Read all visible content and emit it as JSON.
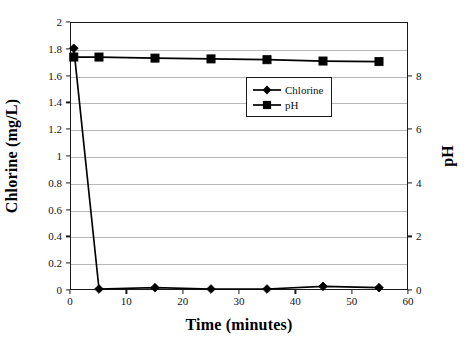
{
  "chart_data": {
    "type": "line",
    "title": "",
    "xlabel": "Time (minutes)",
    "ylabel": "Chlorine (mg/L)",
    "ylabel_secondary": "pH",
    "xlim": [
      0,
      60
    ],
    "ylim": [
      0,
      2
    ],
    "ylim_secondary": [
      0,
      10
    ],
    "grid": true,
    "legend_position": "inside-upper-right",
    "xticks": [
      "0",
      "10",
      "20",
      "30",
      "40",
      "50",
      "60"
    ],
    "xtick_values": [
      0,
      10,
      20,
      30,
      40,
      50,
      60
    ],
    "yticks_left": [
      "0",
      "0.2",
      "0.4",
      "0.6",
      "0.8",
      "1",
      "1.2",
      "1.4",
      "1.6",
      "1.8",
      "2"
    ],
    "ytick_values_left": [
      0,
      0.2,
      0.4,
      0.6,
      0.8,
      1,
      1.2,
      1.4,
      1.6,
      1.8,
      2
    ],
    "yticks_right": [
      "0",
      "2",
      "4",
      "6",
      "8"
    ],
    "ytick_values_right": [
      0,
      2,
      4,
      6,
      8
    ],
    "series": [
      {
        "name": "Chlorine",
        "axis": "left",
        "marker": "diamond",
        "color": "#000000",
        "x": [
          0.5,
          5,
          15,
          25,
          35,
          45,
          55
        ],
        "values": [
          1.81,
          0.0,
          0.01,
          0.0,
          0.0,
          0.02,
          0.01
        ]
      },
      {
        "name": "pH",
        "axis": "right",
        "marker": "square",
        "color": "#000000",
        "x": [
          0.5,
          5,
          15,
          25,
          35,
          45,
          55
        ],
        "values": [
          8.72,
          8.72,
          8.68,
          8.65,
          8.62,
          8.57,
          8.55
        ]
      }
    ],
    "legend": [
      {
        "label": "Chlorine",
        "marker": "diamond"
      },
      {
        "label": "pH",
        "marker": "square"
      }
    ]
  }
}
